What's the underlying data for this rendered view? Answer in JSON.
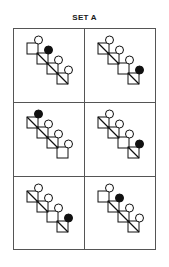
{
  "title": "SET A",
  "colors": {
    "line": "#111111",
    "filled": "#111111",
    "border": "#555555",
    "background": "#ffffff"
  },
  "cells": [
    {
      "position": "row1-left",
      "diagonals": [
        false,
        true,
        true,
        true
      ],
      "filled_circle": 2
    },
    {
      "position": "row1-right",
      "diagonals": [
        true,
        true,
        false,
        true
      ],
      "filled_circle": 4
    },
    {
      "position": "row2-left",
      "diagonals": [
        true,
        true,
        true,
        false
      ],
      "filled_circle": 1
    },
    {
      "position": "row2-right",
      "diagonals": [
        true,
        true,
        false,
        true
      ],
      "filled_circle": 4
    },
    {
      "position": "row3-left",
      "diagonals": [
        true,
        true,
        false,
        true
      ],
      "filled_circle": 4
    },
    {
      "position": "row3-right",
      "diagonals": [
        false,
        true,
        true,
        true
      ],
      "filled_circle": 2
    }
  ]
}
